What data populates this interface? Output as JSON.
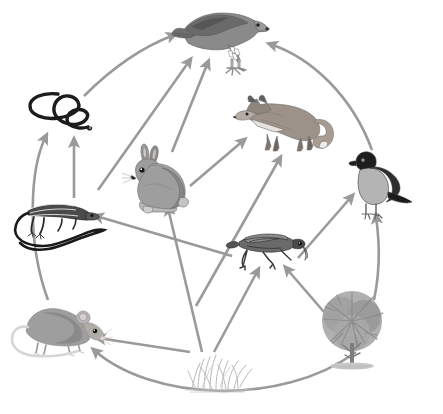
{
  "figure": {
    "name": "food-web-diagram",
    "type": "ecological-food-web",
    "background_color": "#ffffff",
    "width": 443,
    "height": 414,
    "arrow_color": "#9a9a9a",
    "arrow_meaning": "energy flows in the direction of the arrow, from the organism that is eaten to the organism that eats it",
    "has_text_labels": false
  },
  "organisms": [
    {
      "id": "hawk",
      "label": "hawk",
      "icon": "hawk-icon",
      "trophic_level": "tertiary consumer",
      "x": 222,
      "y": 42,
      "scale": 1.0,
      "color": "#6e6e6e"
    },
    {
      "id": "fox",
      "label": "fox",
      "icon": "fox-icon",
      "trophic_level": "secondary consumer",
      "x": 282,
      "y": 123,
      "scale": 1.0,
      "color": "#8a8a8a"
    },
    {
      "id": "snake",
      "label": "snake",
      "icon": "snake-icon",
      "trophic_level": "secondary consumer",
      "x": 62,
      "y": 112,
      "scale": 1.0,
      "color": "#1f1f1f"
    },
    {
      "id": "robin",
      "label": "robin",
      "icon": "robin-icon",
      "trophic_level": "secondary consumer",
      "x": 377,
      "y": 187,
      "scale": 1.0,
      "color": "#4a4a4a"
    },
    {
      "id": "lizard",
      "label": "lizard",
      "icon": "lizard-icon",
      "trophic_level": "secondary consumer",
      "x": 62,
      "y": 228,
      "scale": 1.0,
      "color": "#3a3a3a"
    },
    {
      "id": "rabbit",
      "label": "rabbit",
      "icon": "rabbit-icon",
      "trophic_level": "primary consumer",
      "x": 160,
      "y": 180,
      "scale": 1.0,
      "color": "#8f8f8f"
    },
    {
      "id": "grasshopper",
      "label": "grasshopper",
      "icon": "grasshopper-icon",
      "trophic_level": "primary consumer",
      "x": 266,
      "y": 248,
      "scale": 1.0,
      "color": "#555555"
    },
    {
      "id": "mouse",
      "label": "mouse",
      "icon": "mouse-icon",
      "trophic_level": "primary consumer",
      "x": 62,
      "y": 330,
      "scale": 1.0,
      "color": "#9a9a9a"
    },
    {
      "id": "grass",
      "label": "grass",
      "icon": "grass-icon",
      "trophic_level": "producer",
      "x": 220,
      "y": 372,
      "scale": 1.0,
      "color": "#bdbdbd"
    },
    {
      "id": "tree",
      "label": "tree",
      "icon": "tree-icon",
      "trophic_level": "producer",
      "x": 352,
      "y": 331,
      "scale": 1.0,
      "color": "#a6a6a6"
    }
  ],
  "arrows": [
    {
      "id": "snake-to-hawk",
      "from": "snake",
      "to": "hawk",
      "style": "curved",
      "path": "M 84 96 C 118 62 150 44 174 35"
    },
    {
      "id": "robin-to-hawk",
      "from": "robin",
      "to": "hawk",
      "style": "curved",
      "path": "M 372 150 C 352 96 312 58 270 44"
    },
    {
      "id": "lizard-to-hawk",
      "from": "lizard",
      "to": "hawk",
      "style": "straight",
      "path": "M 98 190 L 190 60"
    },
    {
      "id": "rabbit-to-hawk",
      "from": "rabbit",
      "to": "hawk",
      "style": "straight",
      "path": "M 172 152 L 208 62"
    },
    {
      "id": "lizard-to-snake",
      "from": "lizard",
      "to": "snake",
      "style": "straight",
      "path": "M 74 198 L 74 140"
    },
    {
      "id": "mouse-to-snake",
      "from": "mouse",
      "to": "snake",
      "style": "curved",
      "path": "M 48 300 C 26 240 30 168 46 136"
    },
    {
      "id": "rabbit-to-fox",
      "from": "rabbit",
      "to": "fox",
      "style": "straight",
      "path": "M 190 186 L 244 140"
    },
    {
      "id": "mouse-to-fox",
      "from": "mouse",
      "to": "fox",
      "style": "straight",
      "path": "M 196 306 L 280 158"
    },
    {
      "id": "grasshopper-to-lizard",
      "from": "grasshopper",
      "to": "lizard",
      "style": "straight",
      "path": "M 232 256 L 96 216"
    },
    {
      "id": "grasshopper-to-robin",
      "from": "grasshopper",
      "to": "robin",
      "style": "straight",
      "path": "M 298 258 L 352 196"
    },
    {
      "id": "grass-to-rabbit",
      "from": "grass",
      "to": "rabbit",
      "style": "straight",
      "path": "M 202 352 L 168 208"
    },
    {
      "id": "grass-to-grasshopper",
      "from": "grass",
      "to": "grasshopper",
      "style": "straight",
      "path": "M 214 352 L 258 270"
    },
    {
      "id": "grass-to-mouse",
      "from": "grass",
      "to": "mouse",
      "style": "straight",
      "path": "M 190 352 L 98 338"
    },
    {
      "id": "tree-to-grasshopper",
      "from": "tree",
      "to": "grasshopper",
      "style": "straight",
      "path": "M 324 312 L 286 268"
    },
    {
      "id": "tree-to-robin",
      "from": "tree",
      "to": "robin",
      "style": "curved",
      "path": "M 374 300 C 382 262 378 232 376 216"
    },
    {
      "id": "tree-to-mouse",
      "from": "tree",
      "to": "mouse",
      "style": "curved",
      "path": "M 356 352 C 280 408 150 400 94 350"
    }
  ]
}
